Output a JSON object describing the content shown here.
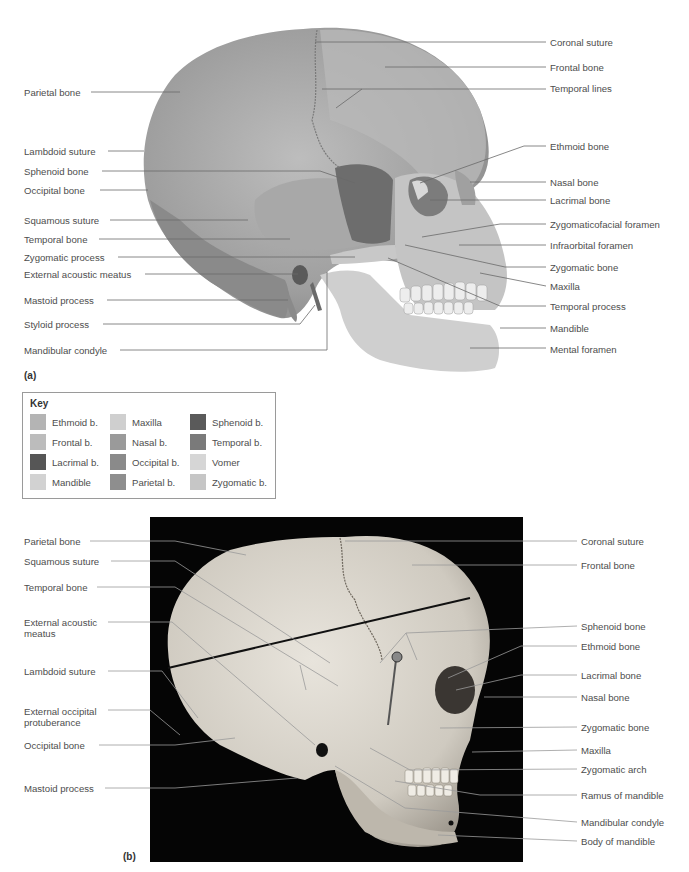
{
  "panel_a": {
    "tag": "(a)",
    "left_labels": [
      {
        "text": "Parietal bone",
        "x": 24,
        "y": 87
      },
      {
        "text": "Lambdoid suture",
        "x": 24,
        "y": 146
      },
      {
        "text": "Sphenoid bone",
        "x": 24,
        "y": 166
      },
      {
        "text": "Occipital bone",
        "x": 24,
        "y": 185
      },
      {
        "text": "Squamous suture",
        "x": 24,
        "y": 215
      },
      {
        "text": "Temporal bone",
        "x": 24,
        "y": 234
      },
      {
        "text": "Zygomatic process",
        "x": 24,
        "y": 252
      },
      {
        "text": "External acoustic meatus",
        "x": 24,
        "y": 269
      },
      {
        "text": "Mastoid process",
        "x": 24,
        "y": 295
      },
      {
        "text": "Styloid process",
        "x": 24,
        "y": 319
      },
      {
        "text": "Mandibular condyle",
        "x": 24,
        "y": 345
      }
    ],
    "right_labels": [
      {
        "text": "Coronal suture",
        "x": 550,
        "y": 37
      },
      {
        "text": "Frontal bone",
        "x": 550,
        "y": 62
      },
      {
        "text": "Temporal lines",
        "x": 550,
        "y": 83
      },
      {
        "text": "Ethmoid bone",
        "x": 550,
        "y": 141
      },
      {
        "text": "Nasal bone",
        "x": 550,
        "y": 177
      },
      {
        "text": "Lacrimal bone",
        "x": 550,
        "y": 195
      },
      {
        "text": "Zygomaticofacial foramen",
        "x": 550,
        "y": 219
      },
      {
        "text": "Infraorbital foramen",
        "x": 550,
        "y": 240
      },
      {
        "text": "Zygomatic bone",
        "x": 550,
        "y": 262
      },
      {
        "text": "Maxilla",
        "x": 550,
        "y": 281
      },
      {
        "text": "Temporal process",
        "x": 550,
        "y": 301
      },
      {
        "text": "Mandible",
        "x": 550,
        "y": 323
      },
      {
        "text": "Mental foramen",
        "x": 550,
        "y": 344
      }
    ]
  },
  "key": {
    "title": "Key",
    "items": [
      {
        "label": "Ethmoid b.",
        "color": "#b4b4b4"
      },
      {
        "label": "Maxilla",
        "color": "#cfcfcf"
      },
      {
        "label": "Sphenoid b.",
        "color": "#5a5a5a"
      },
      {
        "label": "Frontal b.",
        "color": "#bcbcbc"
      },
      {
        "label": "Nasal b.",
        "color": "#9a9a9a"
      },
      {
        "label": "Temporal b.",
        "color": "#7a7a7a"
      },
      {
        "label": "Lacrimal b.",
        "color": "#565656"
      },
      {
        "label": "Occipital b.",
        "color": "#8a8a8a"
      },
      {
        "label": "Vomer",
        "color": "#d6d6d6"
      },
      {
        "label": "Mandible",
        "color": "#d2d2d2"
      },
      {
        "label": "Parietal b.",
        "color": "#8e8e8e"
      },
      {
        "label": "Zygomatic b.",
        "color": "#c6c6c6"
      }
    ]
  },
  "panel_b": {
    "tag": "(b)",
    "left_labels": [
      {
        "text": "Parietal bone",
        "x": 24,
        "y": 536
      },
      {
        "text": "Squamous suture",
        "x": 24,
        "y": 556
      },
      {
        "text": "Temporal bone",
        "x": 24,
        "y": 582
      },
      {
        "text": "External acoustic meatus",
        "x": 24,
        "y": 617,
        "two_line": true
      },
      {
        "text": "Lambdoid suture",
        "x": 24,
        "y": 666
      },
      {
        "text": "External occipital protuberance",
        "x": 24,
        "y": 706,
        "two_line": true
      },
      {
        "text": "Occipital bone",
        "x": 24,
        "y": 740
      },
      {
        "text": "Mastoid process",
        "x": 24,
        "y": 783
      }
    ],
    "right_labels": [
      {
        "text": "Coronal suture",
        "x": 581,
        "y": 536
      },
      {
        "text": "Frontal bone",
        "x": 581,
        "y": 560
      },
      {
        "text": "Sphenoid bone",
        "x": 581,
        "y": 621
      },
      {
        "text": "Ethmoid bone",
        "x": 581,
        "y": 641
      },
      {
        "text": "Lacrimal bone",
        "x": 581,
        "y": 670
      },
      {
        "text": "Nasal bone",
        "x": 581,
        "y": 692
      },
      {
        "text": "Zygomatic bone",
        "x": 581,
        "y": 722
      },
      {
        "text": "Maxilla",
        "x": 581,
        "y": 745
      },
      {
        "text": "Zygomatic arch",
        "x": 581,
        "y": 764
      },
      {
        "text": "Ramus of mandible",
        "x": 581,
        "y": 790
      },
      {
        "text": "Mandibular condyle",
        "x": 581,
        "y": 817
      },
      {
        "text": "Body of mandible",
        "x": 581,
        "y": 836
      }
    ]
  }
}
